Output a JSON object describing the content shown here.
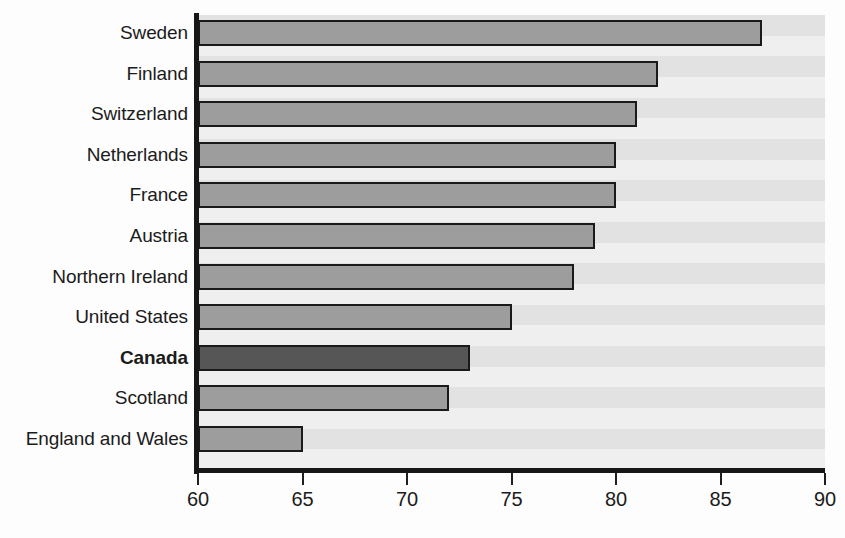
{
  "chart_data": {
    "type": "bar",
    "orientation": "horizontal",
    "title": "",
    "subtitle": "",
    "xlabel": "",
    "ylabel": "",
    "xlim": [
      60,
      90
    ],
    "xticks": [
      60,
      65,
      70,
      75,
      80,
      85,
      90
    ],
    "xtick_labels": [
      "60",
      "65",
      "70",
      "75",
      "80",
      "85",
      "90"
    ],
    "grid": false,
    "legend": null,
    "categories": [
      "Sweden",
      "Finland",
      "Switzerland",
      "Netherlands",
      "France",
      "Austria",
      "Northern Ireland",
      "United States",
      "Canada",
      "Scotland",
      "England and Wales"
    ],
    "values": [
      87,
      82,
      81,
      80,
      80,
      79,
      78,
      75,
      73,
      72,
      65
    ],
    "highlight_category": "Canada",
    "bars": [
      {
        "label": "Sweden",
        "value": 87,
        "highlight": false
      },
      {
        "label": "Finland",
        "value": 82,
        "highlight": false
      },
      {
        "label": "Switzerland",
        "value": 81,
        "highlight": false
      },
      {
        "label": "Netherlands",
        "value": 80,
        "highlight": false
      },
      {
        "label": "France",
        "value": 80,
        "highlight": false
      },
      {
        "label": "Austria",
        "value": 79,
        "highlight": false
      },
      {
        "label": "Northern Ireland",
        "value": 78,
        "highlight": false
      },
      {
        "label": "United States",
        "value": 75,
        "highlight": false
      },
      {
        "label": "Canada",
        "value": 73,
        "highlight": true
      },
      {
        "label": "Scotland",
        "value": 72,
        "highlight": false
      },
      {
        "label": "England and Wales",
        "value": 65,
        "highlight": false
      }
    ],
    "colors": {
      "bar_fill": "#9d9d9d",
      "bar_highlight_fill": "#565656",
      "bar_border": "#1a1a1a",
      "plot_background": "#e8e8e8",
      "band_dark": "#e2e2e2",
      "band_light": "#efefef",
      "axis": "#171717",
      "text": "#1b1b1b"
    }
  }
}
